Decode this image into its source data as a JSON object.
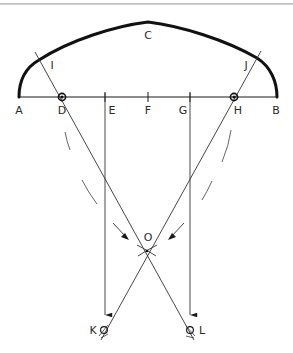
{
  "diagram": {
    "type": "geometric-construction",
    "colors": {
      "stroke": "#1a1a1a",
      "thin": "#333333",
      "dashed": "#555555",
      "background": "#ffffff"
    },
    "labels": {
      "A": "A",
      "B": "B",
      "C": "C",
      "D": "D",
      "E": "E",
      "F": "F",
      "G": "G",
      "H": "H",
      "I": "I",
      "J": "J",
      "K": "K",
      "L": "L",
      "O": "O"
    },
    "points": {
      "A": [
        19,
        97
      ],
      "D": [
        62,
        97
      ],
      "E": [
        105,
        97
      ],
      "F": [
        148,
        97
      ],
      "G": [
        190,
        97
      ],
      "H": [
        234,
        97
      ],
      "B": [
        277,
        97
      ],
      "C": [
        148,
        22
      ],
      "I": [
        39,
        60
      ],
      "J": [
        257,
        58
      ],
      "O": [
        147,
        252
      ],
      "K": [
        105,
        333
      ],
      "L": [
        190,
        333
      ]
    },
    "baseline": {
      "from": "A",
      "to": "B",
      "ticks": [
        "D",
        "E",
        "F",
        "G",
        "H"
      ]
    },
    "arch": {
      "through": [
        "A",
        "I",
        "C",
        "J",
        "B"
      ],
      "weight": "bold"
    },
    "construction_lines": [
      {
        "from": "I",
        "through": [
          "D",
          "O"
        ],
        "to": "L"
      },
      {
        "from": "J",
        "through": [
          "H",
          "O"
        ],
        "to": "K"
      }
    ],
    "vertical_arrows": [
      {
        "from": "E",
        "to_near": "K"
      },
      {
        "from": "G",
        "to_near": "L"
      }
    ],
    "centers_marked": [
      "D",
      "H",
      "K",
      "L"
    ]
  }
}
